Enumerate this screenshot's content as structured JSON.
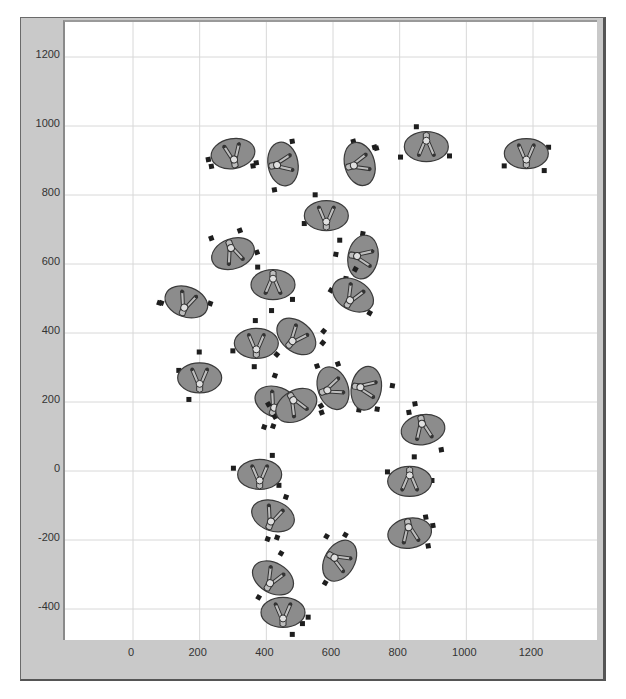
{
  "chart_data": {
    "type": "scatter",
    "title": "",
    "xlabel": "",
    "ylabel": "",
    "xlim": [
      -400,
      1400
    ],
    "ylim": [
      -470,
      1330
    ],
    "grid": true,
    "legend": null,
    "x_ticks": [
      0,
      200,
      400,
      600,
      800,
      1000,
      1200
    ],
    "y_ticks": [
      -400,
      -200,
      0,
      200,
      400,
      600,
      800,
      1000,
      1200
    ],
    "marker": "ellipse-with-person-top-view",
    "colors": {
      "ellipse_fill": "#8c8c8c",
      "ellipse_stroke": "#3a3a3a",
      "person_fill": "#bdbdbd",
      "small_marker": "#1e1e1e",
      "grid": "#d8d8d8",
      "frame": "#c9c9c9"
    },
    "series": [
      {
        "name": "people",
        "points": [
          {
            "x": 300,
            "y": 920,
            "rot": -10
          },
          {
            "x": 450,
            "y": 890,
            "rot": 80
          },
          {
            "x": 680,
            "y": 890,
            "rot": 75
          },
          {
            "x": 880,
            "y": 940,
            "rot": 180
          },
          {
            "x": 1180,
            "y": 920,
            "rot": 0
          },
          {
            "x": 580,
            "y": 740,
            "rot": 0
          },
          {
            "x": 300,
            "y": 630,
            "rot": 160
          },
          {
            "x": 690,
            "y": 620,
            "rot": 100
          },
          {
            "x": 420,
            "y": 540,
            "rot": 180
          },
          {
            "x": 660,
            "y": 510,
            "rot": 30
          },
          {
            "x": 160,
            "y": 490,
            "rot": 20
          },
          {
            "x": 370,
            "y": 370,
            "rot": 0
          },
          {
            "x": 490,
            "y": 390,
            "rot": 40
          },
          {
            "x": 200,
            "y": 270,
            "rot": 0
          },
          {
            "x": 430,
            "y": 200,
            "rot": 20
          },
          {
            "x": 490,
            "y": 190,
            "rot": 150
          },
          {
            "x": 600,
            "y": 240,
            "rot": 70
          },
          {
            "x": 700,
            "y": 240,
            "rot": 100
          },
          {
            "x": 870,
            "y": 120,
            "rot": 170
          },
          {
            "x": 380,
            "y": -10,
            "rot": 0
          },
          {
            "x": 830,
            "y": -30,
            "rot": 180
          },
          {
            "x": 420,
            "y": -130,
            "rot": 20
          },
          {
            "x": 830,
            "y": -180,
            "rot": 170
          },
          {
            "x": 620,
            "y": -260,
            "rot": 120
          },
          {
            "x": 420,
            "y": -310,
            "rot": 30
          },
          {
            "x": 450,
            "y": -410,
            "rot": 0
          }
        ]
      }
    ]
  },
  "axes": {
    "y_labels": [
      "1200",
      "1000",
      "800",
      "600",
      "400",
      "200",
      "0",
      "-200",
      "-400"
    ],
    "x_labels": [
      "0",
      "200",
      "400",
      "600",
      "800",
      "1000",
      "1200"
    ]
  }
}
